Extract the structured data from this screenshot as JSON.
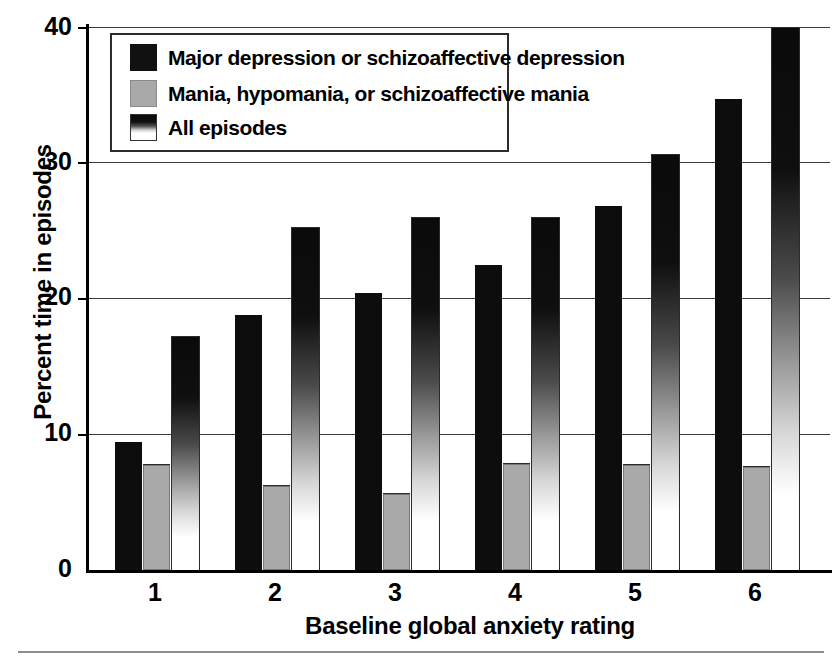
{
  "chart_data": {
    "type": "bar",
    "title": "",
    "xlabel": "Baseline global anxiety rating",
    "ylabel": "Percent time in episodes",
    "categories": [
      "1",
      "2",
      "3",
      "4",
      "5",
      "6"
    ],
    "xtick_labels": [
      "1",
      "2",
      "3",
      "4",
      "5",
      "6"
    ],
    "ytick_labels": [
      "0",
      "10",
      "20",
      "30",
      "40"
    ],
    "yticks": [
      0,
      10,
      20,
      30,
      40
    ],
    "ylim": [
      0,
      40
    ],
    "grid": "horizontal",
    "legend_position": "upper-left-inside",
    "series": [
      {
        "name": "Major depression or schizoaffective depression",
        "fill": "black",
        "color": "#0d0d0d",
        "values": [
          9.4,
          18.8,
          20.4,
          22.5,
          26.8,
          34.7
        ]
      },
      {
        "name": "Mania, hypomania, or schizoaffective mania",
        "fill": "gray",
        "color": "#a9a9a9",
        "values": [
          7.7,
          6.2,
          5.6,
          7.8,
          7.7,
          7.6
        ]
      },
      {
        "name": "All episodes",
        "fill": "gradient-black-to-white",
        "color": "#0a0a0a",
        "values": [
          17.2,
          25.2,
          25.9,
          25.9,
          30.6,
          39.9
        ]
      }
    ]
  },
  "legend": {
    "items": [
      {
        "label": "Major depression or schizoaffective depression",
        "swatch": "black"
      },
      {
        "label": "Mania, hypomania, or schizoaffective mania",
        "swatch": "gray"
      },
      {
        "label": "All episodes",
        "swatch": "gradient"
      }
    ]
  },
  "axes": {
    "y_title": "Percent time in episodes",
    "x_title": "Baseline global anxiety rating",
    "y_ticks": [
      "40",
      "30",
      "20",
      "10",
      "0"
    ],
    "x_ticks": [
      "1",
      "2",
      "3",
      "4",
      "5",
      "6"
    ]
  }
}
